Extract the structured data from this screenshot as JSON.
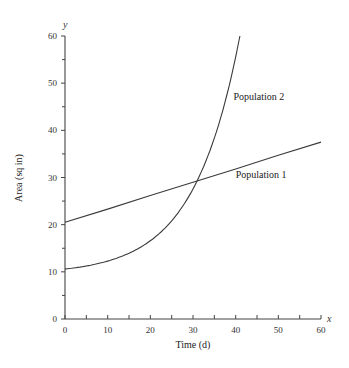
{
  "chart_data": {
    "type": "line",
    "title": "",
    "xlabel": "Time (d)",
    "ylabel": "Area (sq in)",
    "x_axis_letter": "x",
    "y_axis_letter": "y",
    "xlim": [
      0,
      60
    ],
    "ylim": [
      0,
      60
    ],
    "x_ticks": [
      0,
      10,
      20,
      30,
      40,
      50,
      60
    ],
    "x_minor_ticks": [
      5,
      15,
      25,
      35,
      45,
      55
    ],
    "y_ticks": [
      0,
      10,
      20,
      30,
      40,
      50,
      60
    ],
    "y_minor_ticks": [
      5,
      15,
      25,
      35,
      45,
      55
    ],
    "grid": false,
    "legend": "inline labels",
    "series": [
      {
        "name": "Population 1",
        "kind": "linear",
        "x": [
          0,
          10,
          20,
          30,
          40,
          50,
          60
        ],
        "values": [
          20.5,
          23.3,
          26.2,
          29.0,
          31.8,
          34.7,
          37.5
        ],
        "label_pos": [
          40,
          30
        ]
      },
      {
        "name": "Population 2",
        "kind": "exponential",
        "x": [
          0,
          5,
          10,
          15,
          20,
          25,
          30,
          35,
          41
        ],
        "values": [
          10.6,
          11.2,
          12.3,
          14.0,
          16.4,
          20.2,
          27.6,
          37.7,
          60.0
        ],
        "label_pos": [
          39.5,
          46.5
        ]
      }
    ]
  }
}
